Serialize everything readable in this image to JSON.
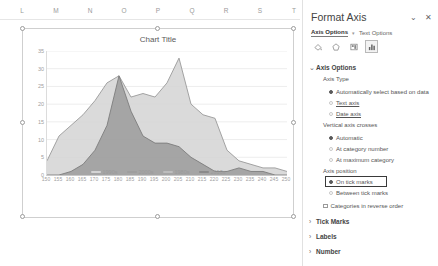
{
  "spreadsheet": {
    "columns": [
      "L",
      "M",
      "N",
      "O",
      "P",
      "Q",
      "R",
      "S",
      "T"
    ]
  },
  "chart": {
    "title": "Chart Title",
    "handles_name": "selection-handle"
  },
  "chart_data": {
    "type": "area",
    "title": "Chart Title",
    "xlabel": "",
    "ylabel": "",
    "ylim": [
      0,
      35
    ],
    "yticks": [
      0,
      5,
      10,
      15,
      20,
      25,
      30,
      35
    ],
    "grid": true,
    "legend_position": "bottom",
    "categories": [
      150,
      155,
      160,
      165,
      170,
      175,
      180,
      185,
      190,
      195,
      200,
      205,
      210,
      215,
      220,
      225,
      230,
      235,
      240,
      245,
      250
    ],
    "series": [
      {
        "name": "1990s",
        "color": "#d4d4d4",
        "values": [
          4,
          11,
          14,
          17,
          21,
          26,
          28,
          22,
          23,
          22,
          26,
          33,
          20,
          17,
          16,
          7,
          4,
          3,
          2,
          2,
          1
        ]
      },
      {
        "name": "2000s",
        "color": "#9e9e9e",
        "values": [
          0,
          0,
          1,
          3,
          7,
          14,
          28,
          18,
          11,
          9,
          9,
          8,
          5,
          3,
          1,
          1,
          2,
          1,
          1,
          0,
          0
        ]
      },
      {
        "name": "1980s",
        "color": "#bdbdbd",
        "values": [
          0,
          0,
          0,
          0,
          0,
          0,
          0,
          0,
          0,
          0,
          0,
          0,
          0,
          0,
          0,
          0,
          0,
          0,
          0,
          0,
          0
        ]
      },
      {
        "name": "2010s",
        "color": "#8a8a8a",
        "values": [
          0,
          0,
          0,
          0,
          0,
          0,
          0,
          0,
          0,
          0,
          0,
          0,
          0,
          0,
          0,
          0,
          0,
          0,
          0,
          0,
          0
        ]
      }
    ],
    "legend": [
      "1990s",
      "2000s",
      "1980s",
      "2010s"
    ]
  },
  "pane": {
    "title": "Format Axis",
    "chevron": "⌄",
    "close": "✕",
    "tabs": [
      {
        "label": "Axis Options",
        "active": true
      },
      {
        "label": "Text Options",
        "active": false
      }
    ],
    "icons": [
      "fill-icon",
      "effects-icon",
      "size-properties-icon",
      "axis-options-icon"
    ],
    "sections": [
      {
        "label": "Axis Options",
        "expanded": true,
        "marker": "⌄"
      },
      {
        "label": "Tick Marks",
        "expanded": false,
        "marker": "›"
      },
      {
        "label": "Labels",
        "expanded": false,
        "marker": "›"
      },
      {
        "label": "Number",
        "expanded": false,
        "marker": "›"
      }
    ],
    "axis_type": {
      "label": "Axis Type",
      "options": [
        {
          "label": "Automatically select based on data",
          "selected": true
        },
        {
          "label": "Text axis",
          "selected": false
        },
        {
          "label": "Date axis",
          "selected": false
        }
      ]
    },
    "vertical_axis_crosses": {
      "label": "Vertical axis crosses",
      "options": [
        {
          "label": "Automatic",
          "selected": true
        },
        {
          "label": "At category number",
          "selected": false
        },
        {
          "label": "At maximum category",
          "selected": false
        }
      ]
    },
    "axis_position": {
      "label": "Axis position",
      "options": [
        {
          "label": "On tick marks",
          "selected": true
        },
        {
          "label": "Between tick marks",
          "selected": false
        }
      ]
    },
    "reverse_order": {
      "label": "Categories in reverse order",
      "checked": false
    }
  }
}
